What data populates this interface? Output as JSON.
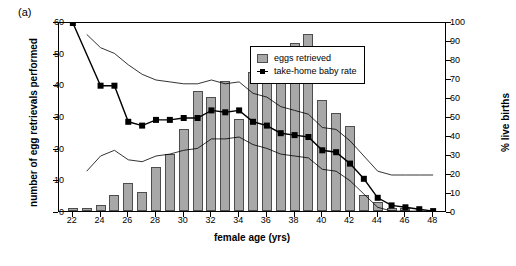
{
  "panel": {
    "label": "(a)"
  },
  "axes": {
    "x_title": "female age (yrs)",
    "y_left_title": "number of egg retrievals performed",
    "y_right_title": "% live births",
    "x_ticks": [
      22,
      24,
      26,
      28,
      30,
      32,
      34,
      36,
      38,
      40,
      42,
      44,
      46,
      48
    ],
    "y_left_ticks": [
      0,
      10,
      20,
      30,
      40,
      50,
      60
    ],
    "y_right_ticks": [
      0,
      10,
      20,
      30,
      40,
      50,
      60,
      70,
      80,
      90,
      100
    ]
  },
  "legend": {
    "items": [
      {
        "label": "eggs retrieved",
        "type": "bar",
        "color": "#a8a8a8"
      },
      {
        "label": "take-home baby rate",
        "type": "line-marker",
        "color": "#000000"
      }
    ]
  },
  "chart_data": {
    "type": "bar",
    "title": "",
    "xlabel": "female age (yrs)",
    "ylabel": "number of egg retrievals performed",
    "y2label": "% live births",
    "xlim": [
      21,
      49
    ],
    "ylim": [
      0,
      60
    ],
    "y2lim": [
      0,
      100
    ],
    "grid": false,
    "legend_position": "top-right-inside",
    "x": [
      22,
      23,
      24,
      25,
      26,
      27,
      28,
      29,
      30,
      31,
      32,
      33,
      34,
      35,
      36,
      37,
      38,
      39,
      40,
      41,
      42,
      43,
      44,
      45,
      46,
      47,
      48
    ],
    "series": [
      {
        "name": "eggs retrieved",
        "type": "bar",
        "axis": "left",
        "values": [
          1,
          1,
          2,
          5,
          9,
          6,
          14,
          18,
          26,
          38,
          36,
          41,
          29,
          44,
          46,
          46,
          53,
          56,
          35,
          31,
          27,
          5,
          3,
          1,
          1,
          0,
          0
        ]
      },
      {
        "name": "take-home baby rate",
        "type": "line-marker",
        "axis": "right",
        "values": [
          100,
          null,
          67,
          67,
          48,
          46,
          49,
          49,
          50,
          50,
          54,
          53,
          54,
          48,
          46,
          42,
          41,
          40,
          33,
          32,
          26,
          18,
          8,
          4,
          3,
          2,
          1
        ]
      },
      {
        "name": "upper confidence limit",
        "type": "line",
        "axis": "right",
        "style": "thin",
        "values": [
          null,
          94,
          87,
          84,
          78,
          73,
          70,
          69,
          68,
          68,
          70,
          68,
          69,
          63,
          61,
          56,
          54,
          52,
          45,
          44,
          38,
          30,
          22,
          20,
          20,
          20,
          20
        ]
      },
      {
        "name": "lower confidence limit",
        "type": "line",
        "axis": "right",
        "style": "thin",
        "values": [
          null,
          22,
          30,
          33,
          28,
          27,
          30,
          31,
          33,
          34,
          39,
          39,
          40,
          36,
          34,
          31,
          30,
          29,
          23,
          22,
          17,
          10,
          3,
          1,
          1,
          1,
          1
        ]
      }
    ]
  }
}
